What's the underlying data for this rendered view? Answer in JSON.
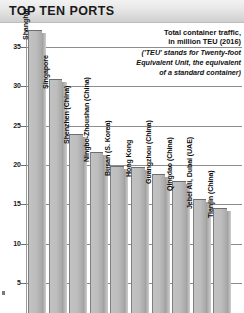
{
  "header": {
    "title": "TOP TEN PORTS"
  },
  "note": {
    "line1": "Total container traffic,",
    "line2": "in million TEU (2016)",
    "line3": "('TEU' stands for Twenty-foot",
    "line4": "Equivalent Unit, the equivalent",
    "line5": "of a standard container)"
  },
  "colors": {
    "bar_fill": "#bdbdbd",
    "bar_edge": "#7f7f7f",
    "gridline": "#8e8e8e",
    "header_bg": "#e2e2e2",
    "text": "#111111"
  },
  "chart_data": {
    "type": "bar",
    "title": "TOP TEN PORTS",
    "subtitle": "Total container traffic, in million TEU (2016)",
    "xlabel": "",
    "ylabel": "million TEU",
    "ylim": [
      0,
      37
    ],
    "yticks": [
      5,
      10,
      15,
      20,
      25,
      30,
      35
    ],
    "grid": true,
    "legend": "none",
    "categories": [
      "Shanghai",
      "Singapore",
      "Shenzhen (China)",
      "Ningbo-Zhoushan (China)",
      "Busan (S. Korea)",
      "Hong Kong",
      "Guangzhou (China)",
      "Qingdao (China)",
      "Jebel Ali, Dubai (UAE)",
      "Tianjin (China)"
    ],
    "values": [
      37.1,
      30.9,
      24.0,
      21.6,
      19.9,
      19.8,
      18.9,
      18.0,
      15.7,
      14.5
    ]
  }
}
